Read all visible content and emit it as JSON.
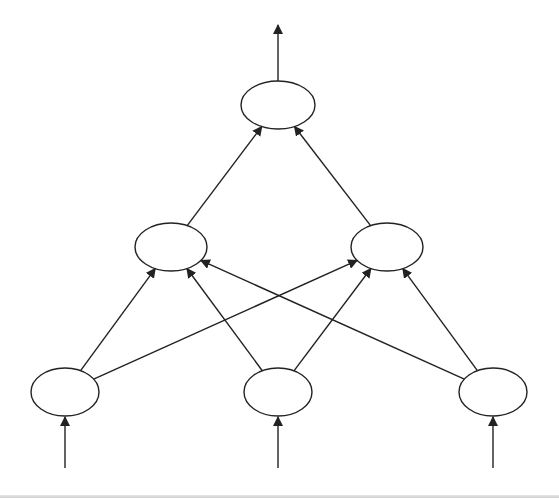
{
  "diagram": {
    "type": "feedforward-network",
    "stroke_color": "#222222",
    "fill_color": "#ffffff",
    "nodes": [
      {
        "id": "in1",
        "layer": "input",
        "cx": 65,
        "cy": 392,
        "rx": 34,
        "ry": 24
      },
      {
        "id": "in2",
        "layer": "input",
        "cx": 278,
        "cy": 392,
        "rx": 34,
        "ry": 24
      },
      {
        "id": "in3",
        "layer": "input",
        "cx": 493,
        "cy": 392,
        "rx": 34,
        "ry": 24
      },
      {
        "id": "h1",
        "layer": "hidden",
        "cx": 171,
        "cy": 247,
        "rx": 36,
        "ry": 24
      },
      {
        "id": "h2",
        "layer": "hidden",
        "cx": 387,
        "cy": 247,
        "rx": 36,
        "ry": 24
      },
      {
        "id": "out",
        "layer": "output",
        "cx": 278,
        "cy": 105,
        "rx": 37,
        "ry": 24
      }
    ],
    "edges": [
      {
        "from": "in1",
        "to": "h1"
      },
      {
        "from": "in1",
        "to": "h2"
      },
      {
        "from": "in2",
        "to": "h1"
      },
      {
        "from": "in2",
        "to": "h2"
      },
      {
        "from": "in3",
        "to": "h1"
      },
      {
        "from": "in3",
        "to": "h2"
      },
      {
        "from": "h1",
        "to": "out"
      },
      {
        "from": "h2",
        "to": "out"
      }
    ],
    "input_arrows": [
      {
        "x": 65,
        "y1": 468,
        "y2": 417
      },
      {
        "x": 278,
        "y1": 468,
        "y2": 417
      },
      {
        "x": 493,
        "y1": 468,
        "y2": 417
      }
    ],
    "output_arrow": {
      "x": 278,
      "y1": 81,
      "y2": 25
    }
  }
}
